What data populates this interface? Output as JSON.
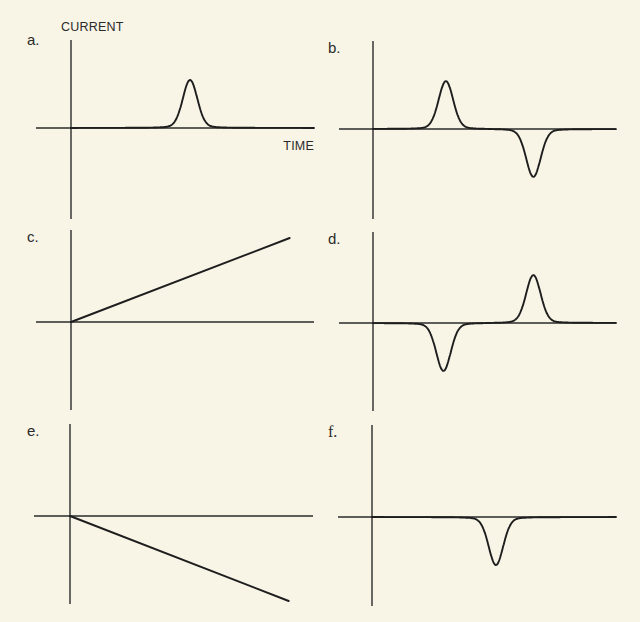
{
  "chart_data": [
    {
      "panel": "a.",
      "type": "line",
      "shape": "gaussian-peaks",
      "ylabel": "CURRENT",
      "xlabel": "TIME",
      "xlim": [
        -0.14,
        1.0
      ],
      "ylim": [
        -1.9,
        1.9
      ],
      "grid": false,
      "peaks": [
        {
          "t": 0.49,
          "amplitude": 1.0,
          "width": 0.03
        }
      ]
    },
    {
      "panel": "b.",
      "type": "line",
      "shape": "gaussian-peaks",
      "ylabel": "",
      "xlabel": "",
      "xlim": [
        -0.14,
        1.0
      ],
      "ylim": [
        -1.9,
        1.9
      ],
      "grid": false,
      "peaks": [
        {
          "t": 0.3,
          "amplitude": 1.0,
          "width": 0.03
        },
        {
          "t": 0.66,
          "amplitude": -1.0,
          "width": 0.03
        }
      ]
    },
    {
      "panel": "c.",
      "type": "line",
      "shape": "ramp",
      "ylabel": "",
      "xlabel": "",
      "xlim": [
        -0.14,
        1.0
      ],
      "ylim": [
        -1.9,
        1.9
      ],
      "grid": false,
      "points": [
        {
          "t": 0.0,
          "current": 0.0
        },
        {
          "t": 0.9,
          "current": 1.75
        }
      ]
    },
    {
      "panel": "d.",
      "type": "line",
      "shape": "gaussian-peaks",
      "ylabel": "",
      "xlabel": "",
      "xlim": [
        -0.14,
        1.0
      ],
      "ylim": [
        -1.9,
        1.9
      ],
      "grid": false,
      "peaks": [
        {
          "t": 0.29,
          "amplitude": -1.0,
          "width": 0.03
        },
        {
          "t": 0.66,
          "amplitude": 1.0,
          "width": 0.03
        }
      ]
    },
    {
      "panel": "e.",
      "type": "line",
      "shape": "ramp",
      "ylabel": "",
      "xlabel": "",
      "xlim": [
        -0.14,
        1.0
      ],
      "ylim": [
        -1.9,
        1.9
      ],
      "grid": false,
      "points": [
        {
          "t": 0.0,
          "current": 0.0
        },
        {
          "t": 0.9,
          "current": -1.77
        }
      ]
    },
    {
      "panel": "f.",
      "type": "line",
      "shape": "gaussian-peaks",
      "ylabel": "",
      "xlabel": "",
      "xlim": [
        -0.14,
        1.0
      ],
      "ylim": [
        -1.9,
        1.9
      ],
      "grid": false,
      "peaks": [
        {
          "t": 0.51,
          "amplitude": -1.0,
          "width": 0.03
        }
      ]
    }
  ]
}
